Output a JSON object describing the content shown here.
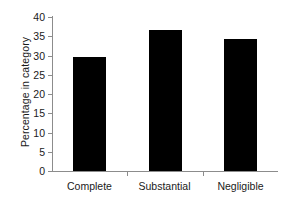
{
  "chart_data": {
    "type": "bar",
    "title": "",
    "subtitle": "",
    "xlabel": "",
    "ylabel": "Percentage in category",
    "categories": [
      "Complete",
      "Substantial",
      "Negligible"
    ],
    "values": [
      29.6,
      36.6,
      34.4
    ],
    "series": [
      {
        "name": "Percentage in category",
        "values": [
          29.6,
          36.6,
          34.4
        ]
      }
    ],
    "ylim": [
      0,
      40
    ],
    "ytick_step": 5,
    "yticks": [
      0,
      5,
      10,
      15,
      20,
      25,
      30,
      35,
      40
    ],
    "ytick_labels": [
      "0",
      "5",
      "10",
      "15",
      "20",
      "25",
      "30",
      "35",
      "40"
    ],
    "xtick_labels": [
      "Complete",
      "Substantial",
      "Negligible"
    ],
    "grid": false,
    "legend": false,
    "legend_position": "none",
    "bar_color": "#000000",
    "axis_color": "#8c8c8c",
    "background_color": "#ffffff",
    "text_color": "#1a1a1a"
  }
}
